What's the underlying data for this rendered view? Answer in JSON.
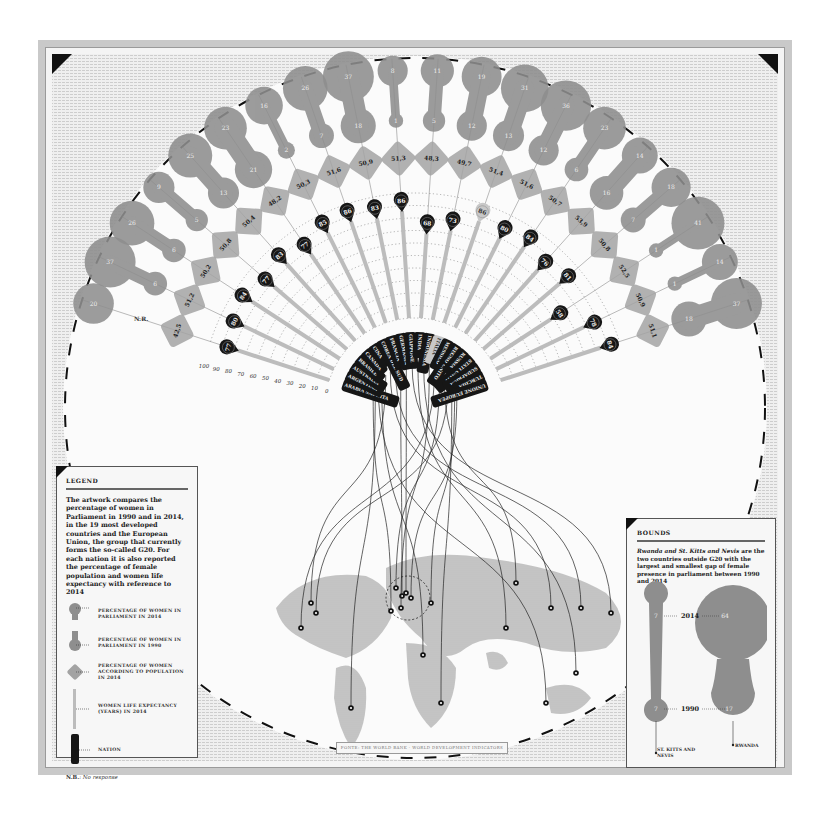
{
  "chart_data": {
    "type": "radial-infographic",
    "axis": {
      "label": "Women life expectancy (years) in 2014",
      "ticks": [
        0,
        10,
        20,
        30,
        40,
        50,
        60,
        70,
        80,
        90,
        100
      ],
      "range": [
        0,
        100
      ]
    },
    "categories": [
      "Arabia Saudita",
      "Argentina",
      "Australia",
      "Brasile",
      "Canada",
      "Cina",
      "Corea del Sud",
      "Francia",
      "Germania",
      "Giappone",
      "India",
      "Indonesia",
      "Italia",
      "Messico",
      "Regno Unito",
      "Russia",
      "Stati Uniti",
      "Sudafrica",
      "Turchia",
      "Unione Europea"
    ],
    "series": [
      {
        "name": "Percentage of women in parliament in 2014",
        "values": [
          20,
          37,
          26,
          9,
          25,
          23,
          16,
          26,
          37,
          8,
          11,
          19,
          31,
          36,
          23,
          14,
          18,
          41,
          14,
          37
        ]
      },
      {
        "name": "Percentage of women in parliament in 1990",
        "values": [
          "N.R.",
          6,
          6,
          5,
          13,
          21,
          2,
          7,
          18,
          1,
          5,
          12,
          13,
          12,
          6,
          16,
          7,
          1,
          1,
          18
        ]
      },
      {
        "name": "Percentage of women according to population in 2014",
        "values": [
          42.5,
          51.2,
          50.2,
          50.8,
          50.4,
          48.2,
          50.3,
          51.6,
          50.9,
          51.3,
          48.3,
          49.7,
          51.4,
          51.6,
          50.7,
          53.9,
          50.8,
          52.5,
          50.9,
          51.1
        ]
      },
      {
        "name": "Women life expectancy (years) in 2014",
        "values": [
          77,
          80,
          84,
          77,
          83,
          77,
          85,
          86,
          83,
          86,
          68,
          73,
          86,
          80,
          84,
          76,
          81,
          58,
          78,
          84
        ]
      }
    ],
    "highlight": "Italia",
    "colors": {
      "blob": "#8e8e8e",
      "blob_overlap": "#6f6f6f",
      "diamond": "#a3a3a3",
      "pin": "#161616",
      "pin_highlight": "#c8c8c8",
      "bar": "#bcbcbc",
      "frame": "#c9c9c9"
    }
  },
  "legend": {
    "title": "LEGEND",
    "description": "The artwork compares the percentage of women in Parliament in 1990 and in 2014, in the 19 most developed countries and the European Union, the group that currently forms the so-called G20. For each nation it is also reported the percentage of female population and women life expectancy with reference to 2014",
    "items": [
      {
        "icon": "parliament-2014-blob",
        "label": "PERCENTAGE OF WOMEN IN PARLIAMENT IN 2014"
      },
      {
        "icon": "parliament-1990-blob",
        "label": "PERCENTAGE OF WOMEN IN PARLIAMENT IN 1990"
      },
      {
        "icon": "population-diamond",
        "label": "PERCENTAGE OF WOMEN ACCORDING TO POPULATION IN 2014"
      },
      {
        "icon": "life-expectancy-bar",
        "label": "WOMEN LIFE EXPECTANCY (YEARS) IN 2014"
      },
      {
        "icon": "nation-tag",
        "label": "NATION"
      }
    ],
    "note_key": "N.B.",
    "note_value": ": No response"
  },
  "bounds": {
    "title": "BOUNDS",
    "description_italic": "Rwanda and St. Kitts and Nevis",
    "description_rest": " are the two countries outside G20 with the largest and smallest gap of female presence in parliament between 1990 and 2014",
    "year_top": "2014",
    "year_bottom": "1990",
    "countries": [
      {
        "name": "ST. KITTS AND NEVIS",
        "v2014": "7",
        "v1990": "7"
      },
      {
        "name": "RWANDA",
        "v2014": "64",
        "v1990": "17"
      }
    ]
  },
  "source": "FONTE: THE WORLD BANK · WORLD DEVELOPMENT INDICATORS"
}
